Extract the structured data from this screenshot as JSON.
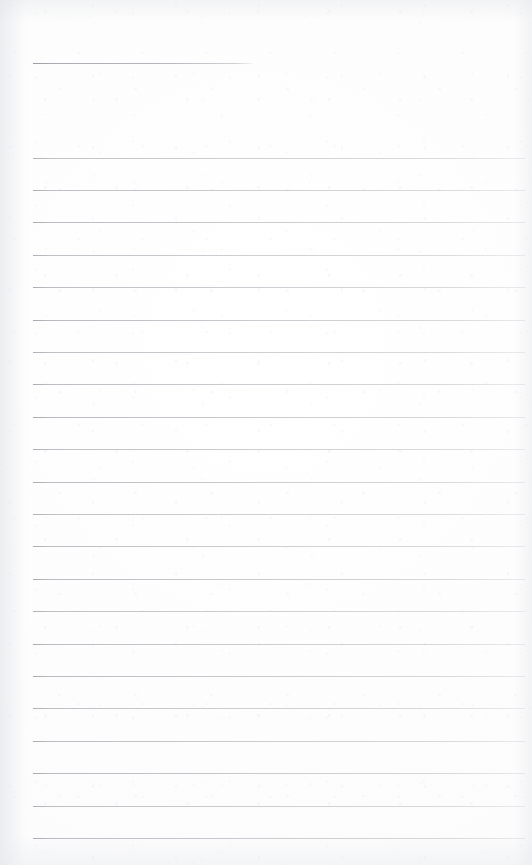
{
  "document": {
    "kind": "scanned-lined-notebook-page",
    "title": "Blank Lined Notebook Page",
    "page_width": 532,
    "page_height": 865,
    "paper_color": "#fdfdfd",
    "rule_color": "#b9babe",
    "written_text": "",
    "content_note": "Page is blank — no handwriting, print, headers, page numbers or annotations are present."
  },
  "rules": {
    "header_rule": {
      "label": "header-rule",
      "x": 33,
      "y": 63,
      "width": 220,
      "full_width": false
    },
    "body": {
      "label": "body-rules",
      "count": 22,
      "x": 33,
      "width": 492,
      "first_y": 157.5,
      "spacing": 32.4,
      "full_width": true
    }
  }
}
